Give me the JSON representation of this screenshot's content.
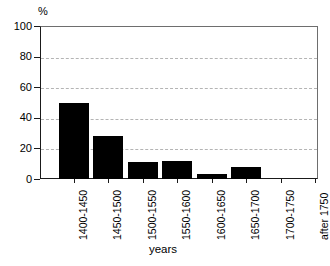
{
  "chart_data": {
    "type": "bar",
    "title": "",
    "subtitle": "",
    "xlabel": "years",
    "ylabel": "%",
    "categories": [
      "1400-1450",
      "1450-1500",
      "1500-1550",
      "1550-1600",
      "1600-1650",
      "1650-1700",
      "1700-1750",
      "after 1750"
    ],
    "values": [
      50,
      28,
      11,
      12,
      3,
      8,
      0,
      0
    ],
    "series": [
      {
        "name": "percentage",
        "values": [
          50,
          28,
          11,
          12,
          3,
          8,
          0,
          0
        ]
      }
    ],
    "ylim": [
      0,
      100
    ],
    "yticks": [
      0,
      20,
      40,
      60,
      80,
      100
    ],
    "ytick_labels": [
      "0",
      "20",
      "40",
      "60",
      "80",
      "100"
    ],
    "grid": "horizontal-dashed",
    "legend": "none",
    "bar_color": "#000000",
    "grid_color": "#b4b4b4",
    "axis_color": "#1a1a1a",
    "background": "#ffffff"
  }
}
